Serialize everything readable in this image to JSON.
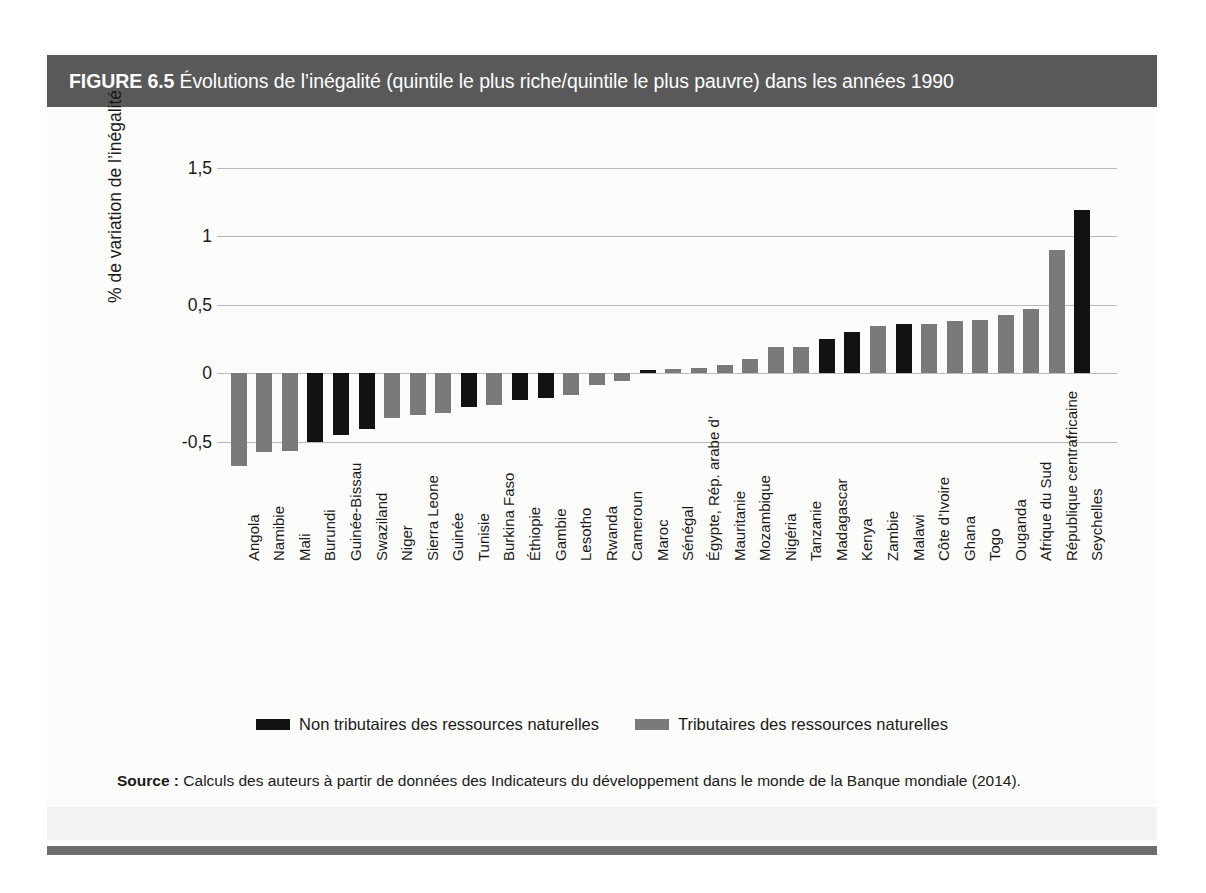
{
  "figure": {
    "number": "FIGURE 6.5",
    "title": "Évolutions de l’inégalité (quintile le plus riche/quintile le plus pauvre) dans les années 1990"
  },
  "source": {
    "label": "Source :",
    "text": " Calculs des auteurs à partir de données des Indicateurs du développement dans le monde de la Banque mondiale (2014)."
  },
  "legend": {
    "items": [
      {
        "label": "Non tributaires des ressources naturelles",
        "color": "#121212"
      },
      {
        "label": "Tributaires des ressources naturelles",
        "color": "#7a7a7a"
      }
    ]
  },
  "colors": {
    "non_resource_rich": "#121212",
    "resource_rich": "#7a7a7a",
    "title_bar": "#595959",
    "gridline": "#b9b9b9",
    "page_frame": "#f2f2f0"
  },
  "chart_data": {
    "type": "bar",
    "title": "Évolutions de l’inégalité (quintile le plus riche/quintile le plus pauvre) dans les années 1990",
    "xlabel": "",
    "ylabel": "% de variation de l’inégalité",
    "ylim": [
      -0.75,
      1.5
    ],
    "yticks": [
      1.5,
      1,
      0.5,
      0,
      -0.5
    ],
    "ytick_labels": [
      "1,5",
      "1",
      "0,5",
      "0",
      "-0,5"
    ],
    "grid": true,
    "legend_position": "bottom",
    "series_key": "group",
    "groups": {
      "black": "Non tributaires des ressources naturelles",
      "grey": "Tributaires des ressources naturelles"
    },
    "categories": [
      "Angola",
      "Namibie",
      "Mali",
      "Burundi",
      "Guinée-Bissau",
      "Swaziland",
      "Niger",
      "Sierra Leone",
      "Guinée",
      "Tunisie",
      "Burkina Faso",
      "Éthiopie",
      "Gambie",
      "Lesotho",
      "Rwanda",
      "Cameroun",
      "Maroc",
      "Sénégal",
      "Égypte, Rép. arabe d’",
      "Mauritanie",
      "Mozambique",
      "Nigéria",
      "Tanzanie",
      "Madagascar",
      "Kenya",
      "Zambie",
      "Malawi",
      "Côte d’Ivoire",
      "Ghana",
      "Togo",
      "Ouganda",
      "Afrique du Sud",
      "République centrafricaine",
      "Seychelles"
    ],
    "values": [
      -0.68,
      -0.58,
      -0.57,
      -0.5,
      -0.45,
      -0.41,
      -0.33,
      -0.31,
      -0.29,
      -0.25,
      -0.23,
      -0.2,
      -0.18,
      -0.16,
      -0.09,
      -0.06,
      0.02,
      0.03,
      0.04,
      0.06,
      0.1,
      0.19,
      0.19,
      0.25,
      0.3,
      0.34,
      0.36,
      0.36,
      0.38,
      0.39,
      0.42,
      0.47,
      0.9,
      1.19
    ],
    "group": [
      "grey",
      "grey",
      "grey",
      "black",
      "black",
      "black",
      "grey",
      "grey",
      "grey",
      "black",
      "grey",
      "black",
      "black",
      "grey",
      "grey",
      "grey",
      "black",
      "grey",
      "grey",
      "grey",
      "grey",
      "grey",
      "grey",
      "black",
      "black",
      "grey",
      "black",
      "grey",
      "grey",
      "grey",
      "grey",
      "grey",
      "grey",
      "black"
    ]
  }
}
